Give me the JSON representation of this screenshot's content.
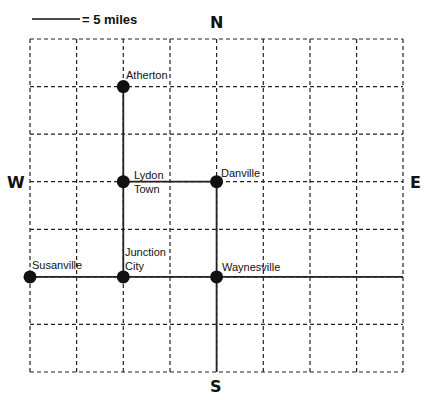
{
  "scale": {
    "label": "= 5 miles"
  },
  "compass": {
    "north": "N",
    "south": "S",
    "east": "E",
    "west": "W"
  },
  "grid": {
    "columns": 8,
    "rows": 7,
    "cell_miles": 5
  },
  "cities": [
    {
      "name": "Atherton",
      "line1": "Atherton",
      "line2": ""
    },
    {
      "name": "Lydon Town",
      "line1": "Lydon",
      "line2": "Town"
    },
    {
      "name": "Danville",
      "line1": "Danville",
      "line2": ""
    },
    {
      "name": "Susanville",
      "line1": "Susanville",
      "line2": ""
    },
    {
      "name": "Junction City",
      "line1": "Junction",
      "line2": "City"
    },
    {
      "name": "Waynesville",
      "line1": "Waynesville",
      "line2": ""
    }
  ],
  "roads": [
    {
      "from": "Atherton",
      "to": "Junction City",
      "direction": "N-S"
    },
    {
      "from": "Lydon Town",
      "to": "Danville",
      "direction": "E-W"
    },
    {
      "from": "Danville",
      "to": "South edge",
      "direction": "N-S"
    },
    {
      "from": "Susanville",
      "to": "East edge",
      "direction": "E-W"
    }
  ]
}
